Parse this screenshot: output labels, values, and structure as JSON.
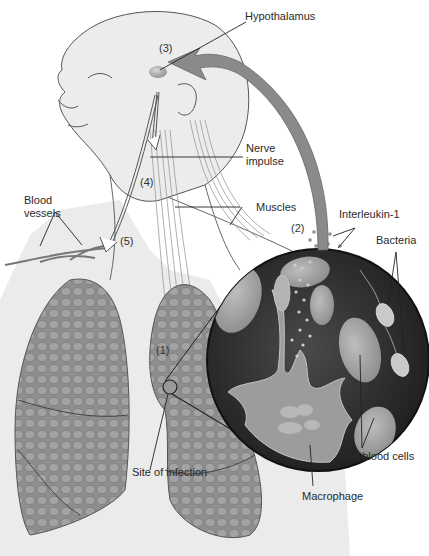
{
  "diagram": {
    "labels": {
      "hypothalamus": "Hypothalamus",
      "nerve_impulse_line1": "Nerve",
      "nerve_impulse_line2": "impulse",
      "blood_vessels_line1": "Blood",
      "blood_vessels_line2": "vessels",
      "muscles": "Muscles",
      "interleukin": "Interleukin-1",
      "bacteria": "Bacteria",
      "site_of_infection": "Site of infection",
      "red_blood_cells": "Red blood cells",
      "macrophage": "Macrophage"
    },
    "steps": {
      "step1": "(1)",
      "step2": "(2)",
      "step3": "(3)",
      "step4": "(4)",
      "step5": "(5)"
    },
    "colors": {
      "skin": "#ececec",
      "outline": "#555555",
      "lung": "#8d8d8d",
      "lung_dark": "#6e6e6e",
      "inset_bg": "#2b2b2b",
      "cell": "#a9a9a9",
      "arrow": "#8a8a8a",
      "muscle": "#b5b5b5"
    }
  }
}
